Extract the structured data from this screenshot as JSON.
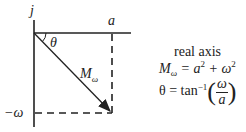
{
  "diagram": {
    "labels": {
      "imag_axis": "j",
      "real_value": "a",
      "angle": "θ",
      "magnitude": "M",
      "magnitude_sub": "ω",
      "imag_value": "−ω"
    },
    "equations": {
      "axis_title": "real axis",
      "magnitude_lhs": "M",
      "magnitude_sub": "ω",
      "magnitude_rhs_a": "= a",
      "magnitude_rhs_plus": " + ω",
      "exp": "2",
      "angle_lhs": "θ = tan",
      "angle_exp": "−1",
      "frac_num": "ω",
      "frac_den": "a"
    },
    "colors": {
      "stroke": "#222222"
    }
  }
}
